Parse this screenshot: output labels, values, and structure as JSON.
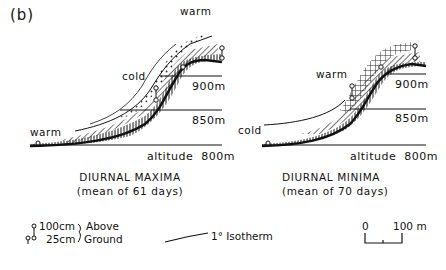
{
  "figure": {
    "panel_label": "(b)",
    "colors": {
      "ink": "#111111",
      "background": "#ffffff"
    }
  },
  "left_panel": {
    "altitudes": [
      "900m",
      "850m",
      "altitude  800m"
    ],
    "zone_labels": {
      "upper": "warm",
      "middle": "cold",
      "lower": "warm"
    },
    "caption_title": "DIURNAL MAXIMA",
    "caption_sub": "(mean of 61 days)"
  },
  "right_panel": {
    "altitudes": [
      "900m",
      "850m",
      "altitude  800m"
    ],
    "zone_labels": {
      "upper": "warm",
      "lower": "cold"
    },
    "caption_title": "DIURNAL MINIMA",
    "caption_sub": "(mean of 70 days)"
  },
  "legend": {
    "sensor_heights": [
      "100cm",
      "25cm"
    ],
    "bracket_labels": [
      "Above",
      "Ground"
    ],
    "isotherm_label": "1° Isotherm",
    "scale": {
      "start": "0",
      "end": "100 m"
    }
  }
}
